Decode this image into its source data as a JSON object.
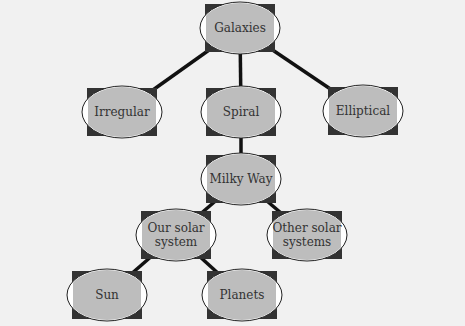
{
  "diagram": {
    "type": "hierarchy",
    "nodes": [
      {
        "id": "galaxies",
        "lines": [
          "Galaxies"
        ]
      },
      {
        "id": "irregular",
        "lines": [
          "Irregular"
        ]
      },
      {
        "id": "spiral",
        "lines": [
          "Spiral"
        ]
      },
      {
        "id": "elliptical",
        "lines": [
          "Elliptical"
        ]
      },
      {
        "id": "milky-way",
        "lines": [
          "Milky Way"
        ]
      },
      {
        "id": "our-solar-system",
        "lines": [
          "Our solar",
          "system"
        ]
      },
      {
        "id": "other-solar-systems",
        "lines": [
          "Other solar",
          "systems"
        ]
      },
      {
        "id": "sun",
        "lines": [
          "Sun"
        ]
      },
      {
        "id": "planets",
        "lines": [
          "Planets"
        ]
      }
    ],
    "edges": [
      [
        "galaxies",
        "irregular"
      ],
      [
        "galaxies",
        "spiral"
      ],
      [
        "galaxies",
        "elliptical"
      ],
      [
        "spiral",
        "milky-way"
      ],
      [
        "milky-way",
        "our-solar-system"
      ],
      [
        "milky-way",
        "other-solar-systems"
      ],
      [
        "our-solar-system",
        "sun"
      ],
      [
        "our-solar-system",
        "planets"
      ]
    ],
    "colors": {
      "background": "#f1f1f1",
      "box": "#333333",
      "ellipse_fill": "#bdbdbd",
      "ellipse_stroke": "#222222",
      "line": "#111111",
      "text": "#333333"
    }
  }
}
